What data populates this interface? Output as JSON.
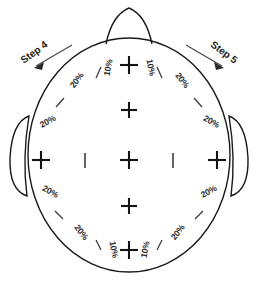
{
  "diagram": {
    "steps": [
      {
        "id": "step-4",
        "label": "Step 4",
        "side": "left"
      },
      {
        "id": "step-5",
        "label": "Step 5",
        "side": "right"
      }
    ],
    "anatomy": {
      "nose_name": "nose",
      "left_ear_name": "left-ear",
      "right_ear_name": "right-ear",
      "head_name": "head-outline"
    },
    "colors": {
      "outline": "#1a1a1a",
      "tick": "#3a3a3a",
      "cross": "#141414",
      "text": "#2b2b2b",
      "background": "#ffffff"
    },
    "percent_labels": [
      {
        "id": "pct-top-left-10",
        "text": "10%",
        "x": 111,
        "y": 68,
        "rotate": -80
      },
      {
        "id": "pct-top-right-10",
        "text": "10%",
        "x": 148,
        "y": 68,
        "rotate": 80
      },
      {
        "id": "pct-top-left-20",
        "text": "20%",
        "x": 79,
        "y": 82,
        "rotate": -52
      },
      {
        "id": "pct-top-right-20",
        "text": "20%",
        "x": 180,
        "y": 82,
        "rotate": 52
      },
      {
        "id": "pct-mid-left-upper-20",
        "text": "20%",
        "x": 49,
        "y": 124,
        "rotate": -28
      },
      {
        "id": "pct-mid-right-upper-20",
        "text": "20%",
        "x": 210,
        "y": 124,
        "rotate": 28
      },
      {
        "id": "pct-mid-left-lower-20",
        "text": "20%",
        "x": 49,
        "y": 194,
        "rotate": 28
      },
      {
        "id": "pct-mid-right-lower-20",
        "text": "20%",
        "x": 210,
        "y": 194,
        "rotate": -28
      },
      {
        "id": "pct-bot-left-20",
        "text": "20%",
        "x": 79,
        "y": 234,
        "rotate": 52
      },
      {
        "id": "pct-bot-right-20",
        "text": "20%",
        "x": 180,
        "y": 234,
        "rotate": -52
      },
      {
        "id": "pct-bot-left-10",
        "text": "10%",
        "x": 111,
        "y": 250,
        "rotate": 80
      },
      {
        "id": "pct-bot-right-10",
        "text": "10%",
        "x": 148,
        "y": 250,
        "rotate": -80
      }
    ],
    "electrodes": [
      {
        "id": "electrode-top",
        "x": 129,
        "y": 65
      },
      {
        "id": "electrode-upper",
        "x": 129,
        "y": 110
      },
      {
        "id": "electrode-center",
        "x": 129,
        "y": 160
      },
      {
        "id": "electrode-lower",
        "x": 129,
        "y": 206
      },
      {
        "id": "electrode-bottom",
        "x": 129,
        "y": 250
      },
      {
        "id": "electrode-left",
        "x": 41,
        "y": 160
      },
      {
        "id": "electrode-right",
        "x": 217,
        "y": 160
      }
    ],
    "bars": [
      {
        "id": "bar-left",
        "x": 85,
        "y": 160
      },
      {
        "id": "bar-right",
        "x": 173,
        "y": 160
      }
    ],
    "ticks": [
      {
        "id": "tick-1",
        "x1": 101,
        "y1": 67,
        "x2": 96,
        "y2": 78
      },
      {
        "id": "tick-2",
        "x1": 157,
        "y1": 67,
        "x2": 162,
        "y2": 78
      },
      {
        "id": "tick-3",
        "x1": 64,
        "y1": 98,
        "x2": 56,
        "y2": 107
      },
      {
        "id": "tick-4",
        "x1": 194,
        "y1": 98,
        "x2": 202,
        "y2": 107
      },
      {
        "id": "tick-5",
        "x1": 63,
        "y1": 219,
        "x2": 55,
        "y2": 211
      },
      {
        "id": "tick-6",
        "x1": 195,
        "y1": 219,
        "x2": 203,
        "y2": 211
      },
      {
        "id": "tick-7",
        "x1": 101,
        "y1": 250,
        "x2": 96,
        "y2": 240
      },
      {
        "id": "tick-8",
        "x1": 157,
        "y1": 250,
        "x2": 162,
        "y2": 240
      }
    ]
  }
}
